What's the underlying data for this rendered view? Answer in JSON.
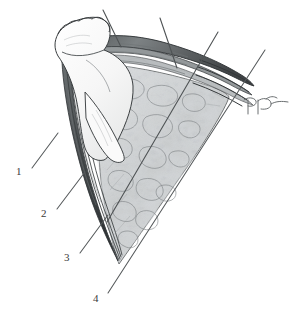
{
  "figure": {
    "type": "anatomical-line-drawing",
    "medium": "pen-and-ink with graphite shading",
    "background_color": "#ffffff",
    "ink_color": "#3a3a3a",
    "tissue_tone": "#b9bcbe",
    "shadow_tone": "#8d9193",
    "width": 301,
    "height": 315,
    "caption": "",
    "subject_description": "Sagittal surgical exposure showing a retracted flap, a dark banded tendinous structure curving to the right, and an underlying wedge of mottled trabecular tissue."
  },
  "labels": [
    {
      "id": "1",
      "text": "1",
      "x": 20,
      "y": 172,
      "leader": {
        "x1": 32,
        "y1": 168,
        "x2": 58,
        "y2": 133
      }
    },
    {
      "id": "2",
      "text": "2",
      "x": 45,
      "y": 214,
      "leader": {
        "x1": 57,
        "y1": 209,
        "x2": 85,
        "y2": 172
      }
    },
    {
      "id": "3",
      "text": "3",
      "x": 68,
      "y": 258,
      "leader": {
        "x1": 80,
        "y1": 253,
        "x2": 108,
        "y2": 215
      }
    },
    {
      "id": "4",
      "text": "4",
      "x": 97,
      "y": 299,
      "leader": {
        "x1": 108,
        "y1": 293,
        "x2": 265,
        "y2": 50
      }
    }
  ],
  "callout_lines": [
    {
      "id": "callout-a",
      "x1": 103,
      "y1": 10,
      "x2": 121,
      "y2": 47
    },
    {
      "id": "callout-b",
      "x1": 160,
      "y1": 18,
      "x2": 177,
      "y2": 68
    },
    {
      "id": "callout-c",
      "x1": 218,
      "y1": 32,
      "x2": 107,
      "y2": 222
    }
  ],
  "signature": {
    "present": true,
    "description": "artist monogram",
    "x": 246,
    "y": 96,
    "width": 44,
    "height": 18
  },
  "structures": [
    {
      "name": "retracted-flap",
      "tone": "#ffffff",
      "outline": "#3a3a3a"
    },
    {
      "name": "tendon-band",
      "tone": "#6f7476",
      "outline": "#2f3234"
    },
    {
      "name": "trabecular-tissue-wedge",
      "tone": "#c3c6c8",
      "outline": "#4a4d4f"
    },
    {
      "name": "fascial-strands",
      "tone": "#5a5e60",
      "outline": "#34383a"
    }
  ]
}
